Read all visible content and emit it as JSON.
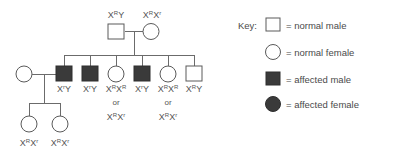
{
  "diagram": {
    "colors": {
      "background": "#ffffff",
      "line": "#6b6b6b",
      "open_symbol_fill": "#ffffff",
      "filled_symbol_fill": "#3a3a3a",
      "text": "#4a4a4a"
    }
  },
  "generation1": {
    "father": {
      "symbol": "normal-male-square",
      "genotype_base": "X",
      "genotype_sup1": "R",
      "genotype_tail": "Y"
    },
    "mother": {
      "symbol": "normal-female-circle",
      "genotype_base": "X",
      "genotype_sup1": "R",
      "genotype_mid": "X",
      "genotype_sup2": "r"
    }
  },
  "generation2": {
    "spouse_left": {
      "symbol": "normal-female-circle",
      "genotype": ""
    },
    "children": [
      {
        "symbol": "affected-male-square",
        "label_parts": [
          "X",
          "r",
          "Y"
        ],
        "alt": null
      },
      {
        "symbol": "affected-male-square",
        "label_parts": [
          "X",
          "r",
          "Y"
        ],
        "alt": null
      },
      {
        "symbol": "normal-female-circle",
        "label_parts": [
          "X",
          "R",
          "X",
          "R"
        ],
        "or_word": "or",
        "alt_parts": [
          "X",
          "R",
          "X",
          "r"
        ]
      },
      {
        "symbol": "affected-male-square",
        "label_parts": [
          "X",
          "r",
          "Y"
        ],
        "alt": null
      },
      {
        "symbol": "normal-female-circle",
        "label_parts": [
          "X",
          "R",
          "X",
          "R"
        ],
        "or_word": "or",
        "alt_parts": [
          "X",
          "R",
          "X",
          "r"
        ]
      },
      {
        "symbol": "normal-male-square",
        "label_parts": [
          "X",
          "R",
          "Y"
        ],
        "alt": null
      }
    ]
  },
  "generation3": {
    "children": [
      {
        "symbol": "normal-female-circle",
        "label_parts": [
          "X",
          "R",
          "X",
          "r"
        ]
      },
      {
        "symbol": "normal-female-circle",
        "label_parts": [
          "X",
          "R",
          "X",
          "r"
        ]
      }
    ]
  },
  "key": {
    "title": "Key:",
    "entries": [
      {
        "symbol": "normal-male-square",
        "text": "= normal male"
      },
      {
        "symbol": "normal-female-circle",
        "text": "= normal female"
      },
      {
        "symbol": "affected-male-square",
        "text": "= affected male"
      },
      {
        "symbol": "affected-female-circle",
        "text": "= affected female"
      }
    ]
  }
}
